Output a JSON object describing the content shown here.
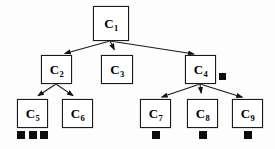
{
  "diagram": {
    "type": "hierarchical-tree",
    "title": "",
    "background_color": "#fdfdfd",
    "node_fill_color": "#ffffff",
    "node_border_color": "#1a1a1a",
    "edge_color": "#1a1a1a",
    "marker_color": "#0d0d0d",
    "nodes": [
      {
        "id": "C1",
        "label": "C",
        "subscript": "1",
        "x": 93,
        "y": 6,
        "w": 36,
        "h": 35,
        "level": 0,
        "markers": 0
      },
      {
        "id": "C2",
        "label": "C",
        "subscript": "2",
        "x": 41,
        "y": 55,
        "w": 31,
        "h": 29,
        "level": 1,
        "markers": 0
      },
      {
        "id": "C3",
        "label": "C",
        "subscript": "3",
        "x": 101,
        "y": 55,
        "w": 32,
        "h": 29,
        "level": 1,
        "markers": 0
      },
      {
        "id": "C4",
        "label": "C",
        "subscript": "4",
        "x": 185,
        "y": 55,
        "w": 31,
        "h": 29,
        "level": 1,
        "markers": 1
      },
      {
        "id": "C5",
        "label": "C",
        "subscript": "5",
        "x": 17,
        "y": 99,
        "w": 31,
        "h": 29,
        "level": 2,
        "markers": 3
      },
      {
        "id": "C6",
        "label": "C",
        "subscript": "6",
        "x": 62,
        "y": 99,
        "w": 31,
        "h": 29,
        "level": 2,
        "markers": 0
      },
      {
        "id": "C7",
        "label": "C",
        "subscript": "7",
        "x": 140,
        "y": 99,
        "w": 31,
        "h": 29,
        "level": 2,
        "markers": 1
      },
      {
        "id": "C8",
        "label": "C",
        "subscript": "8",
        "x": 187,
        "y": 99,
        "w": 31,
        "h": 29,
        "level": 2,
        "markers": 1
      },
      {
        "id": "C9",
        "label": "C",
        "subscript": "9",
        "x": 232,
        "y": 99,
        "w": 31,
        "h": 29,
        "level": 2,
        "markers": 1
      }
    ],
    "edges": [
      {
        "from": "C1",
        "to": "C2",
        "x1": 110,
        "y1": 41,
        "x2": 59,
        "y2": 55
      },
      {
        "from": "C1",
        "to": "C3",
        "x1": 110,
        "y1": 41,
        "x2": 117,
        "y2": 55
      },
      {
        "from": "C1",
        "to": "C4",
        "x1": 110,
        "y1": 41,
        "x2": 200,
        "y2": 55
      },
      {
        "from": "C2",
        "to": "C5",
        "x1": 56,
        "y1": 84,
        "x2": 33,
        "y2": 99
      },
      {
        "from": "C2",
        "to": "C6",
        "x1": 56,
        "y1": 84,
        "x2": 78,
        "y2": 99
      },
      {
        "from": "C4",
        "to": "C7",
        "x1": 200,
        "y1": 84,
        "x2": 156,
        "y2": 99
      },
      {
        "from": "C4",
        "to": "C8",
        "x1": 200,
        "y1": 84,
        "x2": 202,
        "y2": 99
      },
      {
        "from": "C4",
        "to": "C9",
        "x1": 200,
        "y1": 84,
        "x2": 248,
        "y2": 99
      }
    ],
    "markers": [
      {
        "owner": "C4",
        "x": 219,
        "y": 73,
        "size": 7,
        "position": "right"
      },
      {
        "owner": "C5",
        "x": 17,
        "y": 131,
        "size": 8,
        "position": "below"
      },
      {
        "owner": "C5",
        "x": 29,
        "y": 131,
        "size": 8,
        "position": "below"
      },
      {
        "owner": "C5",
        "x": 40,
        "y": 131,
        "size": 8,
        "position": "below"
      },
      {
        "owner": "C7",
        "x": 152,
        "y": 131,
        "size": 8,
        "position": "below"
      },
      {
        "owner": "C8",
        "x": 199,
        "y": 131,
        "size": 8,
        "position": "below"
      },
      {
        "owner": "C9",
        "x": 244,
        "y": 131,
        "size": 8,
        "position": "below"
      }
    ]
  }
}
